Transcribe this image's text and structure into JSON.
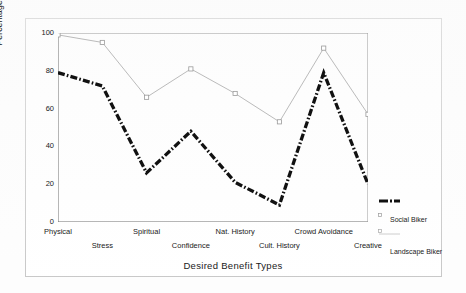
{
  "chart_data": {
    "type": "line",
    "title": "",
    "xlabel": "Desired Benefit Types",
    "ylabel": "Percentage Biker Responses",
    "categories": [
      "Physical",
      "Stress",
      "Spiritual",
      "Confidence",
      "Nat. History",
      "Cult. History",
      "Crowd Avoidance",
      "Creative"
    ],
    "ylim": [
      0,
      100
    ],
    "yticks": [
      0,
      20,
      40,
      60,
      80,
      100
    ],
    "ytick_labels": [
      "0",
      "20",
      "40",
      "60",
      "80",
      "100"
    ],
    "grid": false,
    "legend_position": "right-bottom-outside",
    "series": [
      {
        "name": "Social Biker",
        "values": [
          79,
          72,
          26,
          48,
          21,
          9,
          79,
          20
        ],
        "color": "#111111",
        "style": "dash-dot-thick",
        "marker": "none"
      },
      {
        "name": "Landscape Biker",
        "values": [
          99,
          95,
          66,
          81,
          68,
          53,
          92,
          57
        ],
        "color": "#9a9a9a",
        "style": "solid-thin",
        "marker": "square-open"
      }
    ]
  },
  "legend": {
    "items": [
      {
        "label": "Social Biker",
        "marker_name": "social-biker-line-swatch"
      },
      {
        "label": "Landscape Biker",
        "marker_name": "landscape-biker-line-swatch"
      }
    ]
  }
}
